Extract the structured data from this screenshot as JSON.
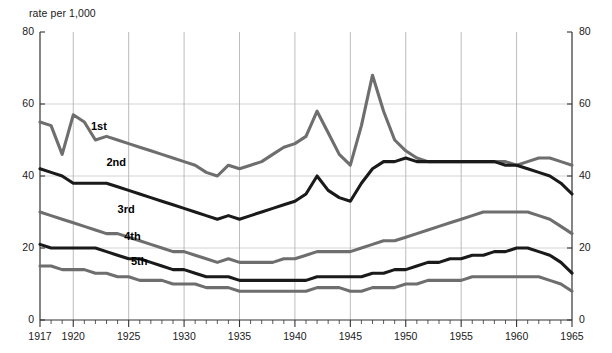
{
  "chart_data": {
    "type": "line",
    "title": "",
    "subtitle": "",
    "ylabel": "rate per 1,000",
    "xlabel": "",
    "xlim": [
      1917,
      1965
    ],
    "ylim": [
      0,
      80
    ],
    "yticks": [
      0,
      20,
      40,
      60,
      80
    ],
    "ytick_labels": [
      "0",
      "20",
      "40",
      "60",
      "80"
    ],
    "yticks_right": [
      0,
      20,
      40,
      60,
      80
    ],
    "ytick_labels_right": [
      "0",
      "20",
      "40",
      "60",
      "80"
    ],
    "xticks": [
      1917,
      1920,
      1925,
      1930,
      1935,
      1940,
      1945,
      1950,
      1955,
      1960,
      1965
    ],
    "xtick_labels": [
      "1917",
      "1920",
      "1925",
      "1930",
      "1935",
      "1940",
      "1945",
      "1950",
      "1955",
      "1960",
      "1965"
    ],
    "minor_xtick_interval": 1,
    "grid": true,
    "grid_x_years": [
      1920,
      1925,
      1930,
      1935,
      1940,
      1945,
      1950,
      1955,
      1960
    ],
    "grid_y_values": [
      20,
      40,
      60
    ],
    "legend": "inline-labels",
    "legend_position": "inline",
    "x": [
      1917,
      1918,
      1919,
      1920,
      1921,
      1922,
      1923,
      1924,
      1925,
      1926,
      1927,
      1928,
      1929,
      1930,
      1931,
      1932,
      1933,
      1934,
      1935,
      1936,
      1937,
      1938,
      1939,
      1940,
      1941,
      1942,
      1943,
      1944,
      1945,
      1946,
      1947,
      1948,
      1949,
      1950,
      1951,
      1952,
      1953,
      1954,
      1955,
      1956,
      1957,
      1958,
      1959,
      1960,
      1961,
      1962,
      1963,
      1964,
      1965
    ],
    "series": [
      {
        "name": "1st",
        "label": "1st",
        "color": "#6e6e6e",
        "label_x": 1921.6,
        "label_y": 53.5,
        "values": [
          55,
          54,
          46,
          57,
          55,
          50,
          51,
          50,
          49,
          48,
          47,
          46,
          45,
          44,
          43,
          41,
          40,
          43,
          42,
          43,
          44,
          46,
          48,
          49,
          51,
          58,
          52,
          46,
          43,
          54,
          68,
          58,
          50,
          47,
          45,
          44,
          44,
          44,
          44,
          44,
          44,
          44,
          44,
          43,
          44,
          45,
          45,
          44,
          43
        ]
      },
      {
        "name": "2nd",
        "label": "2nd",
        "color": "#1a1a1a",
        "label_x": 1923.0,
        "label_y": 43.5,
        "values": [
          42,
          41,
          40,
          38,
          38,
          38,
          38,
          37,
          36,
          35,
          34,
          33,
          32,
          31,
          30,
          29,
          28,
          29,
          28,
          29,
          30,
          31,
          32,
          33,
          35,
          40,
          36,
          34,
          33,
          38,
          42,
          44,
          44,
          45,
          44,
          44,
          44,
          44,
          44,
          44,
          44,
          44,
          43,
          43,
          42,
          41,
          40,
          38,
          35
        ]
      },
      {
        "name": "3rd",
        "label": "3rd",
        "color": "#6e6e6e",
        "label_x": 1924.0,
        "label_y": 30.5,
        "values": [
          30,
          29,
          28,
          27,
          26,
          25,
          24,
          24,
          23,
          22,
          21,
          20,
          19,
          19,
          18,
          17,
          16,
          17,
          16,
          16,
          16,
          16,
          17,
          17,
          18,
          19,
          19,
          19,
          19,
          20,
          21,
          22,
          22,
          23,
          24,
          25,
          26,
          27,
          28,
          29,
          30,
          30,
          30,
          30,
          30,
          29,
          28,
          26,
          24
        ]
      },
      {
        "name": "4th",
        "label": "4th",
        "color": "#1a1a1a",
        "label_x": 1924.6,
        "label_y": 23.0,
        "values": [
          21,
          20,
          20,
          20,
          20,
          20,
          19,
          18,
          17,
          17,
          16,
          15,
          14,
          14,
          13,
          12,
          12,
          12,
          11,
          11,
          11,
          11,
          11,
          11,
          11,
          12,
          12,
          12,
          12,
          12,
          13,
          13,
          14,
          14,
          15,
          16,
          16,
          17,
          17,
          18,
          18,
          19,
          19,
          20,
          20,
          19,
          18,
          16,
          13
        ]
      },
      {
        "name": "5th",
        "label": "5th",
        "color": "#6e6e6e",
        "label_x": 1925.2,
        "label_y": 16.0,
        "values": [
          15,
          15,
          14,
          14,
          14,
          13,
          13,
          12,
          12,
          11,
          11,
          11,
          10,
          10,
          10,
          9,
          9,
          9,
          8,
          8,
          8,
          8,
          8,
          8,
          8,
          9,
          9,
          9,
          8,
          8,
          9,
          9,
          9,
          10,
          10,
          11,
          11,
          11,
          11,
          12,
          12,
          12,
          12,
          12,
          12,
          12,
          11,
          10,
          8
        ]
      }
    ]
  }
}
